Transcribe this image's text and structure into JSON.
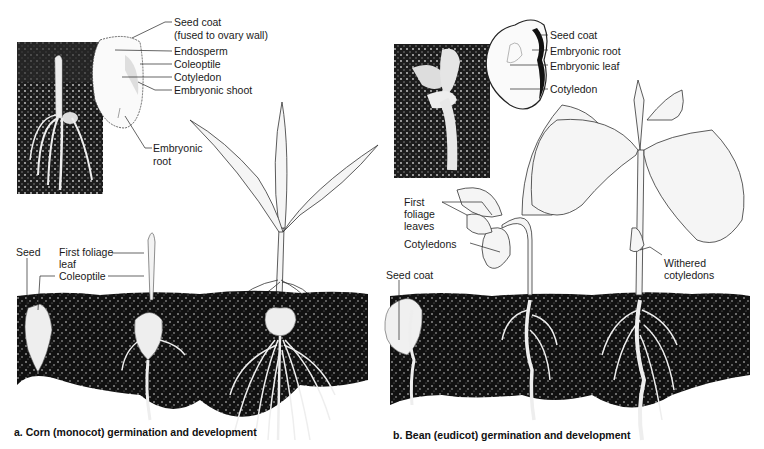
{
  "figure": {
    "panel_a": {
      "caption": "a. Corn (monocot) germination and development",
      "seed_labels": {
        "seed_coat_line1": "Seed coat",
        "seed_coat_line2": "(fused to ovary wall)",
        "endosperm": "Endosperm",
        "coleoptile": "Coleoptile",
        "cotyledon": "Cotyledon",
        "embryonic_shoot": "Embryonic shoot",
        "embryonic_root_line1": "Embryonic",
        "embryonic_root_line2": "root"
      },
      "stage_labels": {
        "seed": "Seed",
        "first_foliage_leaf_line1": "First foliage",
        "first_foliage_leaf_line2": "leaf",
        "coleoptile": "Coleoptile"
      }
    },
    "panel_b": {
      "caption": "b. Bean (eudicot) germination and development",
      "seed_labels": {
        "seed_coat": "Seed coat",
        "embryonic_root": "Embryonic root",
        "embryonic_leaf": "Embryonic leaf",
        "cotyledon": "Cotyledon"
      },
      "stage_labels": {
        "first_foliage_leaves_line1": "First",
        "first_foliage_leaves_line2": "foliage",
        "first_foliage_leaves_line3": "leaves",
        "cotyledons": "Cotyledons",
        "seed_coat": "Seed coat",
        "withered_cotyledons_line1": "Withered",
        "withered_cotyledons_line2": "cotyledons"
      }
    },
    "colors": {
      "soil": "#111111",
      "soil_speckle": "#9a9a9a",
      "line": "#222222",
      "plant_fill": "#f4f4f4",
      "photo_bg": "#1c1c1c"
    }
  }
}
